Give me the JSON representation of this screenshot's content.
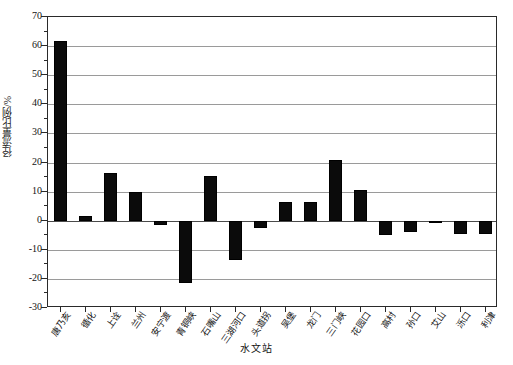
{
  "chart_data": {
    "type": "bar",
    "title": "",
    "subtitle": "",
    "xlabel": "水文站",
    "ylabel": "径流量比例/%",
    "ylim": [
      -30,
      70
    ],
    "ytick_step": 10,
    "yticks": [
      70,
      60,
      50,
      40,
      30,
      20,
      10,
      0,
      -10,
      -20,
      -30
    ],
    "ytick_labels": [
      "70",
      "60",
      "50",
      "40",
      "30",
      "20",
      "10",
      "0",
      "-10",
      "-20",
      "-30"
    ],
    "grid": true,
    "grid_axis": "y",
    "legend": "none",
    "bar_color": "#0b0b0b",
    "bar_edge_color": "#000000",
    "categories": [
      "唐乃亥",
      "循化",
      "上诠",
      "兰州",
      "安宁渡",
      "青铜峡",
      "石嘴山",
      "三湖河口",
      "头道拐",
      "吴堡",
      "龙门",
      "三门峡",
      "花园口",
      "高村",
      "孙口",
      "艾山",
      "泺口",
      "利津"
    ],
    "values": [
      61.8,
      1.5,
      16.5,
      10.0,
      -1.5,
      -21.5,
      15.5,
      -13.5,
      -2.5,
      6.5,
      6.5,
      21.0,
      10.5,
      -5.0,
      -4.0,
      -0.5,
      -4.5,
      -4.5
    ]
  }
}
